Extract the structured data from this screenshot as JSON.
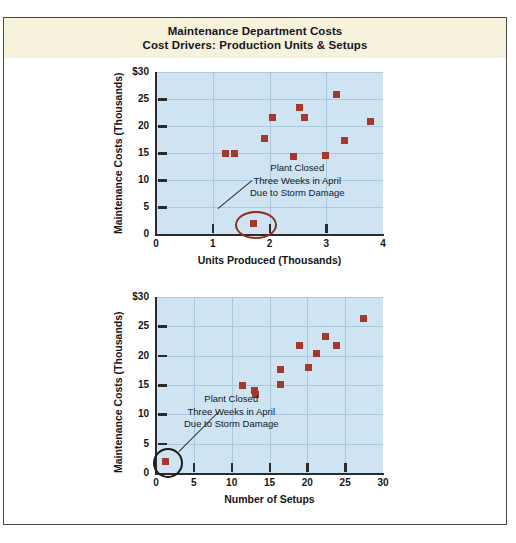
{
  "title": {
    "line1": "Maintenance Department Costs",
    "line2": "Cost Drivers: Production Units & Setups"
  },
  "colors": {
    "band": "#f7f2dc",
    "plot_bg": "#cfe4f2",
    "grid": "#a9c8dd",
    "marker": "#a6382a",
    "frame": "#4a4a4a",
    "annotation_ellipse_1": "#8e2e20",
    "annotation_ellipse_2": "#1b1b1b"
  },
  "annotation": {
    "line1": "Plant Closed",
    "line2": "Three Weeks in April",
    "line3": "Due to Storm Damage"
  },
  "chart_data": [
    {
      "id": "chart-units",
      "type": "scatter",
      "title": "",
      "xlabel": "Units Produced (Thousands)",
      "ylabel": "Maintenance Costs (Thousands)",
      "xlim": [
        0,
        4
      ],
      "ylim": [
        0,
        30
      ],
      "xticks": [
        0,
        1,
        2,
        3,
        4
      ],
      "xticklabels": [
        "0",
        "1",
        "2",
        "3",
        "4"
      ],
      "yticks": [
        0,
        5,
        10,
        15,
        20,
        25,
        30
      ],
      "yticklabels": [
        "0",
        "5",
        "10",
        "15",
        "20",
        "25",
        "$30"
      ],
      "grid": true,
      "legend": "none",
      "points": [
        {
          "x": 1.22,
          "y": 15.0
        },
        {
          "x": 1.38,
          "y": 15.0
        },
        {
          "x": 1.72,
          "y": 2.0,
          "outlier": true
        },
        {
          "x": 1.92,
          "y": 17.6
        },
        {
          "x": 2.05,
          "y": 21.6
        },
        {
          "x": 2.42,
          "y": 14.4
        },
        {
          "x": 2.52,
          "y": 23.4
        },
        {
          "x": 2.62,
          "y": 21.5
        },
        {
          "x": 2.98,
          "y": 14.6
        },
        {
          "x": 3.18,
          "y": 25.9
        },
        {
          "x": 3.32,
          "y": 17.3
        },
        {
          "x": 3.78,
          "y": 20.9
        }
      ]
    },
    {
      "id": "chart-setups",
      "type": "scatter",
      "title": "",
      "xlabel": "Number of Setups",
      "ylabel": "Maintenance Costs (Thousands)",
      "xlim": [
        0,
        30
      ],
      "ylim": [
        0,
        30
      ],
      "xticks": [
        0,
        5,
        10,
        15,
        20,
        25,
        30
      ],
      "xticklabels": [
        "0",
        "5",
        "10",
        "15",
        "20",
        "25",
        "30"
      ],
      "yticks": [
        0,
        5,
        10,
        15,
        20,
        25,
        30
      ],
      "yticklabels": [
        "0",
        "5",
        "10",
        "15",
        "20",
        "25",
        "$30"
      ],
      "grid": true,
      "legend": "none",
      "points": [
        {
          "x": 1.3,
          "y": 2.0,
          "outlier": true
        },
        {
          "x": 11.4,
          "y": 15.0
        },
        {
          "x": 13.0,
          "y": 14.0
        },
        {
          "x": 13.1,
          "y": 13.4
        },
        {
          "x": 16.4,
          "y": 17.6
        },
        {
          "x": 16.5,
          "y": 15.1
        },
        {
          "x": 18.9,
          "y": 21.7
        },
        {
          "x": 20.2,
          "y": 18.0
        },
        {
          "x": 21.2,
          "y": 20.4
        },
        {
          "x": 22.4,
          "y": 23.2
        },
        {
          "x": 23.9,
          "y": 21.8
        },
        {
          "x": 27.4,
          "y": 26.3
        }
      ]
    }
  ]
}
